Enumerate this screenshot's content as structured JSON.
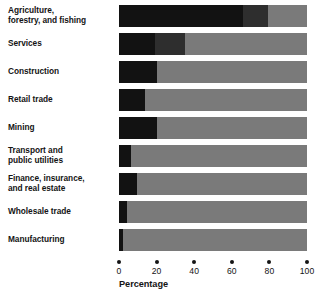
{
  "chart_data": {
    "type": "bar",
    "subtype": "horizontal-stacked-bar",
    "title": "",
    "xlabel": "Percentage",
    "ylabel": "",
    "xlim": [
      0,
      100
    ],
    "grid": false,
    "legend": "none",
    "categories": [
      "Agriculture, forestry, and fishing",
      "Services",
      "Construction",
      "Retail trade",
      "Mining",
      "Transport and public utilities",
      "Finance, insurance, and real estate",
      "Wholesale trade",
      "Manufacturing"
    ],
    "series": [
      {
        "name": "dark-segment",
        "color": "#121212",
        "values": [
          66,
          19,
          20,
          14,
          20,
          6.5,
          9.5,
          4,
          2
        ]
      },
      {
        "name": "medium-segment",
        "color": "#2e2e2e",
        "values": [
          13,
          16,
          0,
          0,
          0,
          0,
          0,
          0,
          0
        ]
      },
      {
        "name": "light-segment",
        "color": "#7a7a7a",
        "values": [
          21,
          65,
          80,
          86,
          80,
          93.5,
          90.5,
          96,
          98
        ]
      }
    ],
    "xticks": [
      0,
      20,
      40,
      60,
      80,
      100
    ],
    "xticklabels": [
      "0",
      "20",
      "40",
      "60",
      "80",
      "100"
    ]
  },
  "labels": [
    {
      "lines": [
        "Agriculture,",
        "forestry, and fishing"
      ]
    },
    {
      "lines": [
        "Services"
      ]
    },
    {
      "lines": [
        "Construction"
      ]
    },
    {
      "lines": [
        "Retail trade"
      ]
    },
    {
      "lines": [
        "Mining"
      ]
    },
    {
      "lines": [
        "Transport and",
        "public utilities"
      ]
    },
    {
      "lines": [
        "Finance, insurance,",
        "and real estate"
      ]
    },
    {
      "lines": [
        "Wholesale trade"
      ]
    },
    {
      "lines": [
        "Manufacturing"
      ]
    }
  ],
  "axis": {
    "title": "Percentage",
    "ticks": [
      "0",
      "20",
      "40",
      "60",
      "80",
      "100"
    ]
  },
  "colors": {
    "dark": "#121212",
    "medium": "#2e2e2e",
    "light": "#7a7a7a",
    "text": "#141414",
    "background": "#ffffff"
  }
}
